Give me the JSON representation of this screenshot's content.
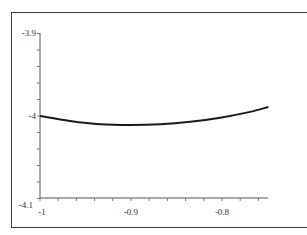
{
  "chart_data": {
    "type": "line",
    "title": "",
    "xlabel": "",
    "ylabel": "",
    "xlim": [
      -1.0,
      -0.75
    ],
    "ylim": [
      -4.1,
      -3.9
    ],
    "grid": false,
    "legend": null,
    "x_ticks": [
      "-1",
      "-0.9",
      "-0.8"
    ],
    "y_ticks": [
      "-3.9",
      "-4",
      "-4.1"
    ],
    "series": [
      {
        "name": "curve",
        "color": "#1a1a1a",
        "x": [
          -1.0,
          -0.967,
          -0.934,
          -0.9,
          -0.868,
          -0.835,
          -0.802,
          -0.769,
          -0.749
        ],
        "y": [
          -4.0,
          -4.006,
          -4.01,
          -4.011,
          -4.01,
          -4.007,
          -4.002,
          -3.995,
          -3.989
        ]
      }
    ]
  },
  "axes": {
    "x_tick_labels": [
      "-1",
      "-0.9",
      "-0.8"
    ],
    "y_tick_labels": [
      "-3.9",
      "-4",
      "-4.1"
    ]
  }
}
